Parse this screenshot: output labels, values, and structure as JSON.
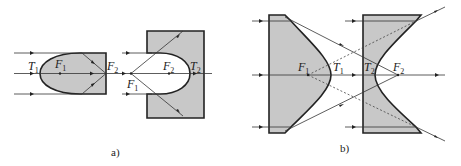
{
  "figure": {
    "panel_a": {
      "caption": "a)",
      "labels": {
        "left_vertex": {
          "main": "T",
          "sub": "1"
        },
        "left_focus_1": {
          "main": "F",
          "sub": "1"
        },
        "left_focus_2": {
          "main": "F",
          "sub": "2"
        },
        "right_focus_1": {
          "main": "F",
          "sub": "1"
        },
        "right_focus_2": {
          "main": "F",
          "sub": "2"
        },
        "right_vertex": {
          "main": "T",
          "sub": "2"
        }
      }
    },
    "panel_b": {
      "caption": "b)",
      "labels": {
        "left_focus": {
          "main": "F",
          "sub": "1"
        },
        "left_vertex": {
          "main": "T",
          "sub": "1"
        },
        "right_vertex": {
          "main": "T",
          "sub": "2"
        },
        "right_focus": {
          "main": "F",
          "sub": "2"
        }
      }
    },
    "colors": {
      "fill": "#c8c8c8",
      "stroke": "#222222"
    }
  }
}
